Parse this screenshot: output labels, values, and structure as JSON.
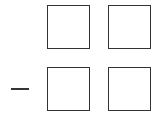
{
  "diagram": {
    "type": "subtraction-digit-boxes",
    "operator": "-",
    "rows": [
      {
        "operator": "",
        "boxes": [
          {
            "value": ""
          },
          {
            "value": ""
          }
        ]
      },
      {
        "operator": "minus",
        "boxes": [
          {
            "value": ""
          },
          {
            "value": ""
          }
        ]
      }
    ],
    "colors": {
      "stroke": "#333333",
      "background": "#ffffff"
    }
  }
}
